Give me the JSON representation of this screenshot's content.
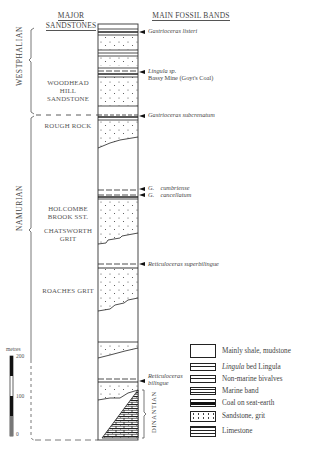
{
  "headers": {
    "major_sandstones_line1": "MAJOR",
    "major_sandstones_line2": "SANDSTONES",
    "main_fossil_bands": "MAIN FOSSIL BANDS"
  },
  "stages": {
    "westphalian": "WESTPHALIAN",
    "namurian": "NAMURIAN",
    "dinantian": "DINANTIAN"
  },
  "sandstones": [
    {
      "line1": "WOODHEAD",
      "line2": "HILL",
      "line3": "SANDSTONE"
    },
    {
      "line1": "ROUGH ROCK"
    },
    {
      "line1": "HOLCOMBE",
      "line2": "BROOK SST."
    },
    {
      "line1": "CHATSWORTH",
      "line2": "GRIT"
    },
    {
      "line1": "ROACHES GRIT"
    }
  ],
  "fossil_bands": [
    {
      "name": "Gastrioceras listeri"
    },
    {
      "name": "Lingula sp.",
      "note": "Bassy Mine (Goyt's Coal)"
    },
    {
      "name": "Gastrioceras subcrenatum"
    },
    {
      "genus": "G.",
      "species": "cumbriense"
    },
    {
      "genus": "G.",
      "species": "cancellatum"
    },
    {
      "name": "Reticuloceras superbilingue"
    },
    {
      "line1": "Reticuloceras",
      "line2": "bilingue"
    }
  ],
  "scale": {
    "unit": "metres",
    "ticks": [
      "200",
      "100",
      "0"
    ]
  },
  "legend": [
    {
      "pattern": "shale",
      "label": "Mainly shale, mudstone"
    },
    {
      "pattern": "lingula",
      "label_italic": "Lingula",
      "label_rest": " bed  Lingula"
    },
    {
      "pattern": "nonmarine",
      "label": "Non-marine bivalves"
    },
    {
      "pattern": "marine",
      "label": "Marine band"
    },
    {
      "pattern": "coal",
      "label": "Coal on seat-earth"
    },
    {
      "pattern": "sandstone",
      "label": "Sandstone, grit"
    },
    {
      "pattern": "limestone",
      "label": "Limestone"
    }
  ]
}
